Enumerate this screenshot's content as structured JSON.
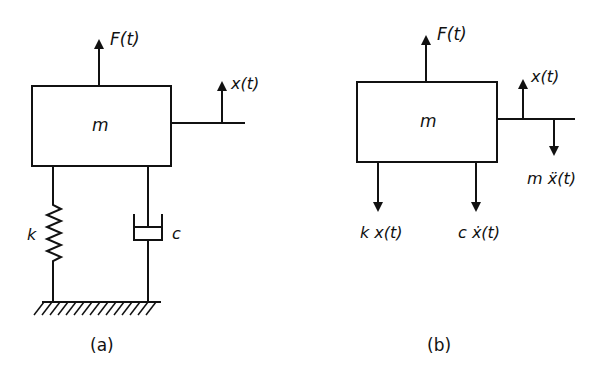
{
  "figure_a": {
    "caption": "(a)",
    "mass_label": "m",
    "force_label": "F(t)",
    "displacement_label": "x(t)",
    "spring_label": "k",
    "damper_label": "c"
  },
  "figure_b": {
    "caption": "(b)",
    "mass_label": "m",
    "force_label": "F(t)",
    "displacement_label": "x(t)",
    "inertia_label": "m ẍ(t)",
    "spring_force_label": "k x(t)",
    "damper_force_label": "c ẋ(t)"
  },
  "colors": {
    "ink": "#111111",
    "background": "#ffffff"
  }
}
